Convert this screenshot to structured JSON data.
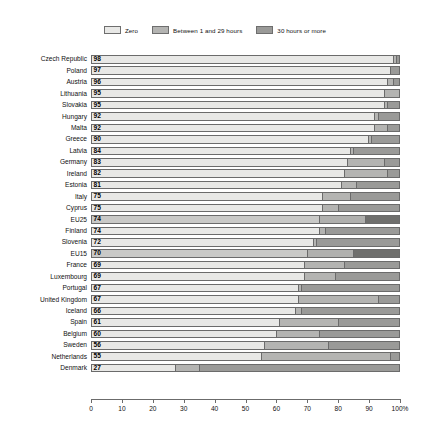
{
  "legend": {
    "items": [
      {
        "label": "Zero",
        "key": "zero",
        "color": "#e8e8e6"
      },
      {
        "label": "Between 1 and 29 hours",
        "key": "mid",
        "color": "#b4b4b2"
      },
      {
        "label": "30 hours or more",
        "key": "high",
        "color": "#9a9a98"
      }
    ]
  },
  "axis": {
    "ticks": [
      "0",
      "10",
      "20",
      "30",
      "40",
      "50",
      "60",
      "70",
      "80",
      "90",
      "100%"
    ],
    "min": 0,
    "max": 100,
    "unit": "%"
  },
  "chart_data": {
    "type": "bar",
    "orientation": "horizontal",
    "stacked": true,
    "title": "",
    "subtitle": "",
    "xlabel": "",
    "ylabel": "",
    "xlim": [
      0,
      100
    ],
    "grid": false,
    "legend_position": "top-center",
    "series": [
      {
        "name": "Zero",
        "color": "#e8e8e6"
      },
      {
        "name": "Between 1 and 29 hours",
        "color": "#b4b4b2"
      },
      {
        "name": "30 hours or more",
        "color": "#9a9a98"
      }
    ],
    "categories": [
      "Czech Republic",
      "Poland",
      "Austria",
      "Lithuania",
      "Slovakia",
      "Hungary",
      "Malta",
      "Greece",
      "Latvia",
      "Germany",
      "Ireland",
      "Estonia",
      "Italy",
      "Cyprus",
      "EU25",
      "Finland",
      "Slovenia",
      "EU15",
      "France",
      "Luxembourg",
      "Portugal",
      "United Kingdom",
      "Iceland",
      "Spain",
      "Belgium",
      "Sweden",
      "Netherlands",
      "Denmark"
    ],
    "rows": [
      {
        "label": "Czech Republic",
        "zero": 98,
        "mid": 1,
        "high": 1,
        "highlight": false
      },
      {
        "label": "Poland",
        "zero": 97,
        "mid": 0,
        "high": 3,
        "highlight": false
      },
      {
        "label": "Austria",
        "zero": 96,
        "mid": 2,
        "high": 2,
        "highlight": false
      },
      {
        "label": "Lithuania",
        "zero": 95,
        "mid": 5,
        "high": 0,
        "highlight": false
      },
      {
        "label": "Slovakia",
        "zero": 95,
        "mid": 1,
        "high": 4,
        "highlight": false
      },
      {
        "label": "Hungary",
        "zero": 92,
        "mid": 1,
        "high": 7,
        "highlight": false
      },
      {
        "label": "Malta",
        "zero": 92,
        "mid": 4,
        "high": 4,
        "highlight": false
      },
      {
        "label": "Greece",
        "zero": 90,
        "mid": 1,
        "high": 9,
        "highlight": false
      },
      {
        "label": "Latvia",
        "zero": 84,
        "mid": 1,
        "high": 15,
        "highlight": false
      },
      {
        "label": "Germany",
        "zero": 83,
        "mid": 12,
        "high": 5,
        "highlight": false
      },
      {
        "label": "Ireland",
        "zero": 82,
        "mid": 14,
        "high": 4,
        "highlight": false
      },
      {
        "label": "Estonia",
        "zero": 81,
        "mid": 5,
        "high": 14,
        "highlight": false
      },
      {
        "label": "Italy",
        "zero": 75,
        "mid": 9,
        "high": 16,
        "highlight": false
      },
      {
        "label": "Cyprus",
        "zero": 75,
        "mid": 5,
        "high": 20,
        "highlight": false
      },
      {
        "label": "EU25",
        "zero": 74,
        "mid": 15,
        "high": 11,
        "highlight": true
      },
      {
        "label": "Finland",
        "zero": 74,
        "mid": 2,
        "high": 24,
        "highlight": false
      },
      {
        "label": "Slovenia",
        "zero": 72,
        "mid": 1,
        "high": 27,
        "highlight": false
      },
      {
        "label": "EU15",
        "zero": 70,
        "mid": 15,
        "high": 15,
        "highlight": true
      },
      {
        "label": "France",
        "zero": 69,
        "mid": 13,
        "high": 18,
        "highlight": false
      },
      {
        "label": "Luxembourg",
        "zero": 69,
        "mid": 10,
        "high": 21,
        "highlight": false
      },
      {
        "label": "Portugal",
        "zero": 67,
        "mid": 1,
        "high": 32,
        "highlight": false
      },
      {
        "label": "United Kingdom",
        "zero": 67,
        "mid": 26,
        "high": 7,
        "highlight": false
      },
      {
        "label": "Iceland",
        "zero": 66,
        "mid": 2,
        "high": 32,
        "highlight": false
      },
      {
        "label": "Spain",
        "zero": 61,
        "mid": 19,
        "high": 20,
        "highlight": false
      },
      {
        "label": "Belgium",
        "zero": 60,
        "mid": 14,
        "high": 26,
        "highlight": false
      },
      {
        "label": "Sweden",
        "zero": 56,
        "mid": 21,
        "high": 23,
        "highlight": false
      },
      {
        "label": "Netherlands",
        "zero": 55,
        "mid": 42,
        "high": 3,
        "highlight": false
      },
      {
        "label": "Denmark",
        "zero": 27,
        "mid": 8,
        "high": 65,
        "highlight": false
      }
    ]
  }
}
